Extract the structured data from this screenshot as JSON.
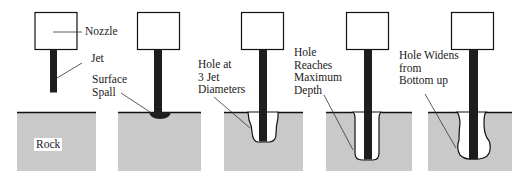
{
  "diagram": {
    "colors": {
      "rock": "#c9c9c9",
      "outline": "#111111",
      "jet": "#1e1e1e",
      "background": "#ffffff"
    },
    "labels": {
      "nozzle": "Nozzle",
      "jet": "Jet",
      "rock": "Rock",
      "surface_spall": "Surface\nSpall",
      "hole_3_jet": "Hole at\n3 Jet\nDiameters",
      "hole_max_depth": "Hole\nReaches\nMaximum\nDepth",
      "hole_widens": "Hole Widens\nfrom\nBottom up"
    },
    "stages": [
      {
        "id": 1,
        "name": "initial"
      },
      {
        "id": 2,
        "name": "surface-spall"
      },
      {
        "id": 3,
        "name": "hole-3-jet-diameters"
      },
      {
        "id": 4,
        "name": "hole-maximum-depth"
      },
      {
        "id": 5,
        "name": "hole-widens"
      }
    ]
  }
}
